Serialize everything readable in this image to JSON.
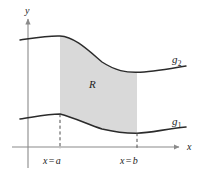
{
  "figure": {
    "background_color": "#ffffff",
    "axes": {
      "x_axis_label": "x",
      "y_axis_label": "y",
      "axis_color": "#8a8a8a",
      "x_axis_y_px": 147,
      "y_axis_x_px": 28,
      "x_axis_start_px": 12,
      "x_axis_end_px": 180,
      "y_axis_top_px": 17,
      "y_axis_bottom_px": 168
    },
    "curves": [
      {
        "name": "g2",
        "label": "g",
        "subscript": "2",
        "role": "upper-boundary",
        "color": "#2b2b2b",
        "label_x_px": 176,
        "label_y_px": 60,
        "points_px": [
          [
            20,
            40
          ],
          [
            34,
            38
          ],
          [
            48,
            36
          ],
          [
            60,
            36
          ],
          [
            74,
            42
          ],
          [
            88,
            52
          ],
          [
            102,
            62
          ],
          [
            116,
            69
          ],
          [
            130,
            72
          ],
          [
            144,
            72
          ],
          [
            158,
            70
          ],
          [
            172,
            68
          ],
          [
            186,
            66
          ]
        ]
      },
      {
        "name": "g1",
        "label": "g",
        "subscript": "1",
        "role": "lower-boundary",
        "color": "#2b2b2b",
        "label_x_px": 176,
        "label_y_px": 122,
        "points_px": [
          [
            20,
            119
          ],
          [
            34,
            117
          ],
          [
            48,
            114
          ],
          [
            60,
            114
          ],
          [
            74,
            118
          ],
          [
            88,
            124
          ],
          [
            102,
            129
          ],
          [
            116,
            132
          ],
          [
            130,
            133
          ],
          [
            144,
            133
          ],
          [
            158,
            131
          ],
          [
            172,
            129
          ],
          [
            186,
            127
          ]
        ]
      }
    ],
    "region": {
      "label": "R",
      "fill_color": "#d9d9d9",
      "label_x_px": 93,
      "label_y_px": 84,
      "left_bound_px": 60,
      "right_bound_px": 137
    },
    "vertical_markers": [
      {
        "name": "x-equals-a",
        "variable": "x",
        "operator": "=",
        "value": "a",
        "x_px": 60,
        "label_x_px": 60,
        "label_y_px": 160,
        "dash_from_y_px": 114,
        "dash_to_y_px": 147,
        "style": "dashed",
        "color": "#4d4d4d"
      },
      {
        "name": "x-equals-b",
        "variable": "x",
        "operator": "=",
        "value": "b",
        "x_px": 137,
        "label_x_px": 137,
        "label_y_px": 160,
        "dash_from_y_px": 133,
        "dash_to_y_px": 147,
        "style": "dashed",
        "color": "#4d4d4d"
      }
    ]
  }
}
